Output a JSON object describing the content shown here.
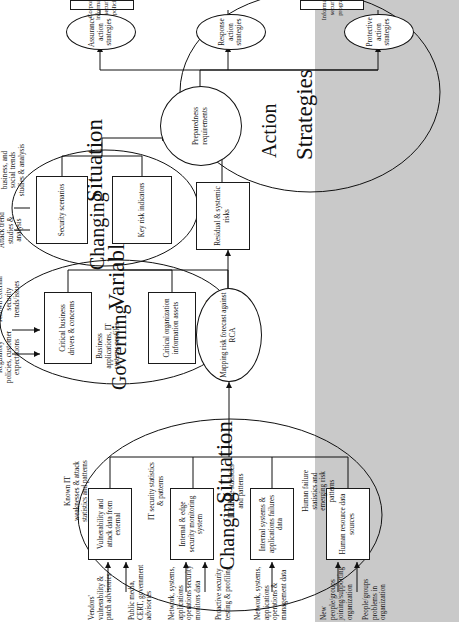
{
  "figure": {
    "title_parts": {
      "changing_situation_left": {
        "word1": "Changing",
        "word2": "Situation"
      },
      "governing_variables": {
        "word1": "Governing",
        "word2": "Variables"
      },
      "changing_situation_right": {
        "word1": "Changing",
        "word2": "Situation"
      },
      "action_strategies": {
        "word1": "Action",
        "word2": "Strategies"
      }
    },
    "colors": {
      "shaded_band": "#c9c9c9",
      "stroke": "#111111",
      "background": "#ffffff"
    }
  },
  "changing_situation_inputs": [
    {
      "id": "in-1",
      "label": "Vendors' vulnerability & patch advisories"
    },
    {
      "id": "in-2",
      "label": "Public media, CERT, government advisories"
    },
    {
      "id": "in-3",
      "label": "Network, systems, applications operations security monitors data"
    },
    {
      "id": "in-4",
      "label": "Proactive security testing & profiling"
    },
    {
      "id": "in-5",
      "label": "Network, systems, applications operations & management data"
    },
    {
      "id": "in-6",
      "label": "New people/groups joining/supporting organization"
    },
    {
      "id": "in-7",
      "label": "People/groups problems in organization"
    }
  ],
  "changing_situation_boxes": [
    {
      "id": "cs-box-1",
      "label": "Vulnerability and attack data from external"
    },
    {
      "id": "cs-box-2",
      "label": "Internal & edge security monitoring system"
    },
    {
      "id": "cs-box-3",
      "label": "Internal systems & applications failures data"
    },
    {
      "id": "cs-box-4",
      "label": "Human resource data sources"
    }
  ],
  "changing_situation_outputs": [
    {
      "id": "cs-out-1",
      "label": "Known IT weaknesses & attack statistics and patterns"
    },
    {
      "id": "cs-out-2",
      "label": "IT security statistics & patterns"
    },
    {
      "id": "cs-out-3",
      "label": "IT failure statistics and patterns"
    },
    {
      "id": "cs-out-4",
      "label": "Human failure statistics and emerging risk patterns"
    }
  ],
  "governing_variables": {
    "boxes": [
      {
        "id": "gv-box-1",
        "label": "Critical business drivers & concerns"
      },
      {
        "id": "gv-box-2",
        "label": "Critical organization information assets"
      }
    ],
    "inputs": [
      {
        "id": "gv-in-1",
        "label": "Regulatory policies, customer expectations"
      },
      {
        "id": "gv-in-2",
        "label": "Known external security trends/issues"
      },
      {
        "id": "gv-in-3",
        "label": "Business applications, IT systems profiles"
      }
    ],
    "output": {
      "id": "gv-out-1",
      "label": "Requirements for criticality alignment (RCA)"
    }
  },
  "changing_situation_right": {
    "boxes": [
      {
        "id": "csr-box-1",
        "label": "Key risk indicators"
      },
      {
        "id": "csr-box-2",
        "label": "Security scenarios"
      }
    ],
    "inputs": [
      {
        "id": "csr-in-1",
        "label": "Attack trend studies & analysis"
      },
      {
        "id": "csr-in-2",
        "label": "Technology, business, and social trends studies & analysis"
      }
    ]
  },
  "process_nodes": [
    {
      "id": "proc-1",
      "label": "Mapping risk forecast against RCA",
      "shape": "oval"
    },
    {
      "id": "proc-2",
      "label": "Residual & systemic risks",
      "shape": "box"
    },
    {
      "id": "proc-3",
      "label": "Preparedness requirements",
      "shape": "oval"
    }
  ],
  "action_strategies": {
    "nodes": [
      {
        "id": "as-1",
        "label": "Assurance action strategies"
      },
      {
        "id": "as-2",
        "label": "Response action strategies"
      },
      {
        "id": "as-3",
        "label": "Protective action strategies"
      }
    ],
    "outputs": [
      {
        "id": "as-out-1",
        "label": "Corporate information security policies"
      },
      {
        "id": "as-out-2",
        "label": "Information security program"
      }
    ]
  }
}
